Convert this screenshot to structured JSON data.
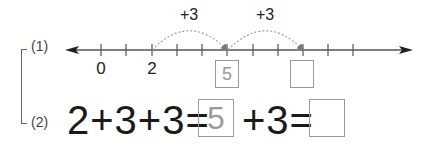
{
  "problem1": {
    "label": "(1)",
    "number_line": {
      "tick_labels": [
        {
          "text": "0",
          "x": 101
        },
        {
          "text": "2",
          "x": 152
        }
      ],
      "jumps": [
        {
          "label": "+3",
          "from_x": 152,
          "to_x": 227
        },
        {
          "label": "+3",
          "from_x": 227,
          "to_x": 303
        }
      ],
      "answer_boxes": [
        {
          "value": "5",
          "x": 215
        },
        {
          "value": "",
          "x": 290
        }
      ]
    }
  },
  "problem2": {
    "label": "(2)",
    "equation": {
      "part1": "2+3+3=",
      "box1_value": "5",
      "part2": "+3=",
      "box2_value": ""
    }
  },
  "colors": {
    "line": "#555555",
    "arc": "#999999",
    "box_border": "#9a9a9a",
    "filled_answer": "#9a9a9a"
  }
}
